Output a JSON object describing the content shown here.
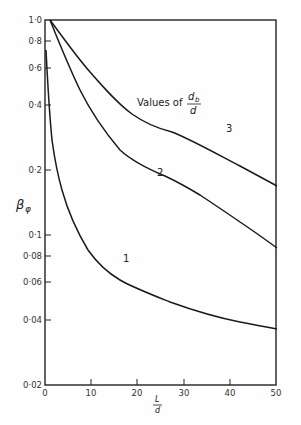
{
  "chart_data": {
    "type": "line",
    "title": "",
    "xlabel": "L/d",
    "ylabel": "β_φ",
    "xscale": "linear",
    "yscale": "log",
    "xlim": [
      0,
      50
    ],
    "ylim": [
      0.02,
      1.0
    ],
    "grid": false,
    "x_ticks": [
      "0",
      "10",
      "20",
      "30",
      "40",
      "50"
    ],
    "y_ticks": [
      "1·0",
      "0·8",
      "0·6",
      "0·4",
      "0·2",
      "0·1",
      "0·08",
      "0·06",
      "0·04",
      "0·02"
    ],
    "legend_title": "Values of d_b/d",
    "series": [
      {
        "name": "1",
        "x": [
          0.2,
          0.6,
          1.5,
          3.2,
          5.4,
          8.7,
          14.1,
          20.6,
          29.2,
          40.0,
          50.0
        ],
        "y": [
          0.72,
          0.47,
          0.27,
          0.17,
          0.11,
          0.08,
          0.061,
          0.052,
          0.044,
          0.037,
          0.034
        ]
      },
      {
        "name": "2",
        "x": [
          1.1,
          4.3,
          7.6,
          11.9,
          16.2,
          20.6,
          26.0,
          33.5,
          42.2,
          50.0
        ],
        "y": [
          1.0,
          0.69,
          0.47,
          0.32,
          0.25,
          0.21,
          0.19,
          0.15,
          0.114,
          0.087
        ]
      },
      {
        "name": "3",
        "x": [
          1.1,
          5.4,
          9.7,
          14.1,
          18.4,
          22.7,
          27.1,
          33.5,
          42.2,
          50.0
        ],
        "y": [
          1.0,
          0.74,
          0.57,
          0.44,
          0.37,
          0.32,
          0.3,
          0.26,
          0.21,
          0.17
        ]
      }
    ]
  },
  "labels": {
    "legend_prefix": "Values of",
    "legend_num": "d",
    "legend_sub": "b",
    "legend_den": "d",
    "ylabel_main": "β",
    "ylabel_sub": "φ",
    "xlabel_num": "L",
    "xlabel_den": "d",
    "curve1": "1",
    "curve2": "2",
    "curve3": "3"
  },
  "x_ticks": [
    {
      "label": "0",
      "x": 45
    },
    {
      "label": "10",
      "x": 91
    },
    {
      "label": "20",
      "x": 137
    },
    {
      "label": "30",
      "x": 184
    },
    {
      "label": "40",
      "x": 230
    },
    {
      "label": "50",
      "x": 276
    }
  ],
  "y_ticks": [
    {
      "label": "1·0",
      "y": 20
    },
    {
      "label": "0·8",
      "y": 41
    },
    {
      "label": "0·6",
      "y": 68
    },
    {
      "label": "0·4",
      "y": 105
    },
    {
      "label": "0·2",
      "y": 170
    },
    {
      "label": "0·1",
      "y": 235
    },
    {
      "label": "0·08",
      "y": 256
    },
    {
      "label": "0·06",
      "y": 282
    },
    {
      "label": "0·04",
      "y": 320
    },
    {
      "label": "0·02",
      "y": 385
    }
  ]
}
